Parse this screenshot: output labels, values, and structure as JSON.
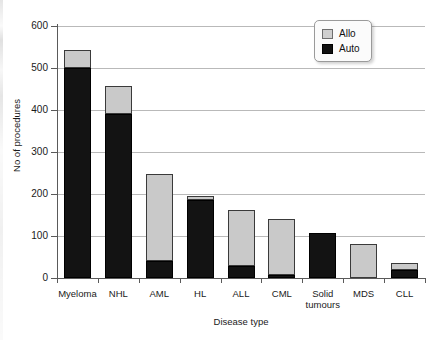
{
  "chart_data": {
    "type": "bar",
    "subtype": "stacked",
    "title": "",
    "xlabel": "Disease type",
    "ylabel": "No of procedures",
    "ylim": [
      0,
      600
    ],
    "yticks": [
      0,
      100,
      200,
      300,
      400,
      500,
      600
    ],
    "grid": "horizontal",
    "legend_position": "top-right",
    "categories": [
      "Myeloma",
      "NHL",
      "AML",
      "HL",
      "ALL",
      "CML",
      "Solid tumours",
      "MDS",
      "CLL"
    ],
    "series": [
      {
        "name": "Auto",
        "color": "#131313",
        "values": [
          500,
          390,
          40,
          186,
          28,
          7,
          107,
          0,
          18
        ]
      },
      {
        "name": "Allo",
        "color": "#c9c9c9",
        "values": [
          43,
          67,
          208,
          9,
          135,
          133,
          0,
          80,
          17
        ]
      }
    ],
    "totals": [
      543,
      457,
      248,
      195,
      163,
      140,
      107,
      80,
      35
    ]
  },
  "legend": {
    "items": [
      {
        "label": "Allo",
        "swatch": "allo-swatch"
      },
      {
        "label": "Auto",
        "swatch": "auto-swatch"
      }
    ]
  },
  "axis": {
    "y_title": "No of procedures",
    "x_title": "Disease type",
    "y_tick_labels": [
      "600",
      "500",
      "400",
      "300",
      "200",
      "100",
      "0"
    ],
    "x_tick_labels": [
      [
        "Myeloma"
      ],
      [
        "NHL"
      ],
      [
        "AML"
      ],
      [
        "HL"
      ],
      [
        "ALL"
      ],
      [
        "CML"
      ],
      [
        "Solid",
        "tumours"
      ],
      [
        "MDS"
      ],
      [
        "CLL"
      ]
    ]
  }
}
